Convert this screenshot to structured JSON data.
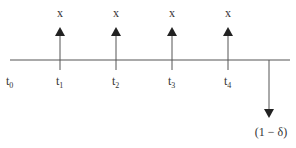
{
  "diagram": {
    "type": "cash-flow-timeline",
    "line_color": "#555555",
    "arrow_color": "#222222",
    "time_labels": [
      {
        "base": "t",
        "sub": "0"
      },
      {
        "base": "t",
        "sub": "1"
      },
      {
        "base": "t",
        "sub": "2"
      },
      {
        "base": "t",
        "sub": "3"
      },
      {
        "base": "t",
        "sub": "4"
      }
    ],
    "inflows": [
      {
        "at": "t1",
        "label": "x"
      },
      {
        "at": "t2",
        "label": "x"
      },
      {
        "at": "t3",
        "label": "x"
      },
      {
        "at": "t4",
        "label": "x"
      }
    ],
    "outflow": {
      "label": "(1 − δ)"
    }
  }
}
